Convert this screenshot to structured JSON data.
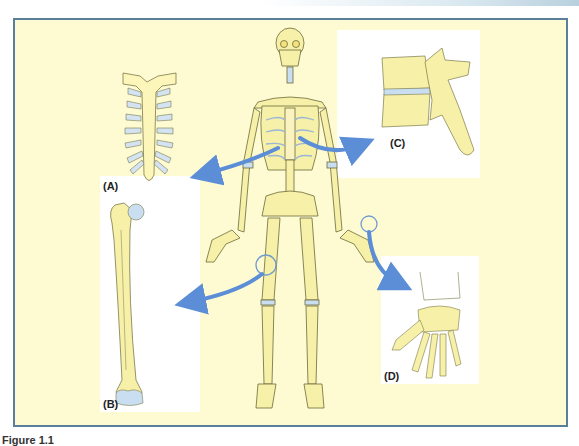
{
  "figure": {
    "panels": [
      {
        "id": "A",
        "label": "(A)",
        "subject": "sternum-and-costal-cartilages"
      },
      {
        "id": "B",
        "label": "(B)",
        "subject": "femur"
      },
      {
        "id": "C",
        "label": "(C)",
        "subject": "vertebrae-with-intervertebral-disc"
      },
      {
        "id": "D",
        "label": "(D)",
        "subject": "wrist-and-hand-bones"
      }
    ],
    "center": {
      "subject": "full-human-skeleton"
    },
    "caption": "Figure 1.1"
  },
  "colors": {
    "background": "#fefbd3",
    "frame_border": "#5a7f9a",
    "bone_fill": "#f7f0a8",
    "bone_outline": "#6b6a3a",
    "cartilage": "#c9def0",
    "arrow": "#5b8ed6",
    "highlight_circle": "#6f9ccf"
  }
}
